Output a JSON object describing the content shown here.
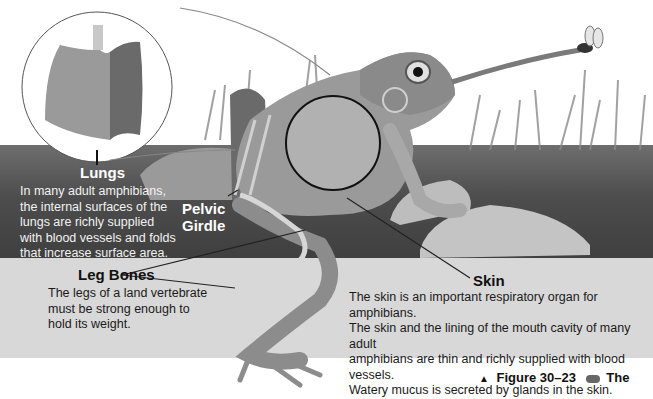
{
  "figure": {
    "caption_marker": "▲",
    "caption_label": "Figure 30–23",
    "caption_text": "The",
    "caption_icon": "web-link-icon"
  },
  "callouts": {
    "lungs": {
      "title": "Lungs",
      "body": [
        "In many adult amphibians,",
        "the internal surfaces of the",
        "lungs are richly supplied",
        "with blood vessels and folds",
        "that increase surface area."
      ]
    },
    "pelvic_girdle": {
      "title_line1": "Pelvic",
      "title_line2": "Girdle"
    },
    "leg_bones": {
      "title": "Leg Bones",
      "body": [
        "The legs of a land vertebrate",
        "must be strong enough to",
        "hold its weight."
      ]
    },
    "skin": {
      "title": "Skin",
      "body": [
        "The skin is an important respiratory organ for amphibians.",
        "The skin and the lining of the mouth cavity of many adult",
        "amphibians are thin and richly supplied with blood vessels.",
        "Watery mucus is secreted by glands in the skin."
      ]
    }
  },
  "illustration": {
    "subject": "frog catching an insect with its tongue, with lung inset",
    "inset": "lungs-detail"
  }
}
